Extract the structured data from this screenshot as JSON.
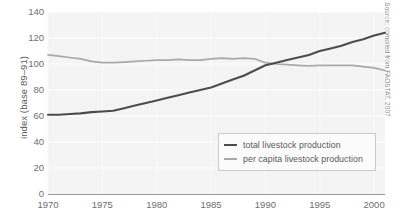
{
  "chart_data": {
    "type": "line",
    "title": "",
    "xlabel": "",
    "ylabel": "index (base 89–91)",
    "source_note": "Source: compiled from FAOSTAT, 2007",
    "xlim": [
      1970,
      2001
    ],
    "ylim": [
      0,
      140
    ],
    "yticks": [
      0,
      20,
      40,
      60,
      80,
      100,
      120,
      140
    ],
    "xticks": [
      1970,
      1975,
      1980,
      1985,
      1990,
      1995,
      2000
    ],
    "grid": true,
    "legend_position": "inside-bottom-right",
    "x": [
      1970,
      1971,
      1972,
      1973,
      1974,
      1975,
      1976,
      1977,
      1978,
      1979,
      1980,
      1981,
      1982,
      1983,
      1984,
      1985,
      1986,
      1987,
      1988,
      1989,
      1990,
      1991,
      1992,
      1993,
      1994,
      1995,
      1996,
      1997,
      1998,
      1999,
      2000,
      2001
    ],
    "series": [
      {
        "name": "total livestock production",
        "color": "#4d4d4f",
        "values": [
          61,
          61,
          61.5,
          62,
          63,
          63.5,
          64,
          66,
          68,
          70,
          72,
          74,
          76,
          78,
          80,
          82,
          85,
          88,
          91,
          95,
          99,
          101,
          103,
          105,
          107,
          110,
          112,
          114,
          117,
          119,
          122,
          124
        ]
      },
      {
        "name": "per capita livestock production",
        "color": "#a7a9ac",
        "values": [
          107,
          106,
          105,
          104,
          102,
          101,
          101,
          101.5,
          102,
          102.5,
          103,
          103,
          103.5,
          103,
          103,
          104,
          104.5,
          104,
          104.5,
          104,
          101,
          100,
          99.5,
          99,
          98.5,
          99,
          99,
          99,
          99,
          98,
          97,
          95
        ]
      }
    ]
  },
  "legend": {
    "items": [
      {
        "label": "total livestock production",
        "color": "#4d4d4f"
      },
      {
        "label": "per capita livestock production",
        "color": "#a7a9ac"
      }
    ]
  }
}
